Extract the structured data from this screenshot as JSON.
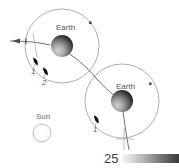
{
  "figure": {
    "type": "orbital-trajectory-diagram",
    "background_color": "#ffffff",
    "width": 179,
    "height": 168,
    "labels": {
      "earth_first": "Earth",
      "earth_second": "Earth",
      "sun": "Sun",
      "marker_1_first_flyby": "1",
      "marker_2_first_flyby": "2",
      "marker_1_second_flyby": "1",
      "scale_value": "25"
    },
    "bodies": [
      {
        "name": "earth-first-encounter",
        "label": "Earth",
        "cx": 62,
        "cy": 46,
        "r": 11,
        "shading": "terminator-upper-right-dark"
      },
      {
        "name": "earth-second-encounter",
        "label": "Earth",
        "cx": 122,
        "cy": 101,
        "r": 11,
        "shading": "terminator-upper-right-dark"
      },
      {
        "name": "sun",
        "label": "Sun",
        "cx": 42,
        "cy": 133,
        "r": 9,
        "shading": "bright-outline"
      }
    ],
    "orbits": [
      {
        "name": "orbit-first-encounter",
        "cx": 62,
        "cy": 46,
        "r": 37
      },
      {
        "name": "orbit-second-encounter",
        "cx": 122,
        "cy": 101,
        "r": 37
      }
    ],
    "orbit_markers": [
      {
        "name": "orbit-marker-first",
        "cx": 90,
        "cy": 23
      },
      {
        "name": "orbit-marker-second",
        "cx": 150,
        "cy": 84
      }
    ],
    "satellites": [
      {
        "name": "satellite-1-first-flyby",
        "label": "1",
        "cx": 36,
        "cy": 62
      },
      {
        "name": "satellite-2-first-flyby",
        "label": "2",
        "cx": 46,
        "cy": 72
      },
      {
        "name": "satellite-1-second-flyby",
        "label": "1",
        "cx": 97,
        "cy": 120
      }
    ],
    "trajectory": {
      "name": "spacecraft-trajectory",
      "direction_arrow": "left",
      "stroke_color": "#555555"
    },
    "colors": {
      "line": "#6b6b6b",
      "orbit": "#8c8c8c",
      "earth_dark": "#1a1a1a",
      "earth_light": "#c8c8c8",
      "sun_fill": "#fbfbfb",
      "sun_edge": "#b4b4b4",
      "text": "#4a4a4a",
      "scale_gradient_start": "#f2f2f2",
      "scale_gradient_end": "#3b3b3b"
    },
    "scale": {
      "name": "grayscale-scalebar",
      "value": "25",
      "gradient_from": "#f2f2f2",
      "gradient_to": "#3b3b3b"
    }
  }
}
